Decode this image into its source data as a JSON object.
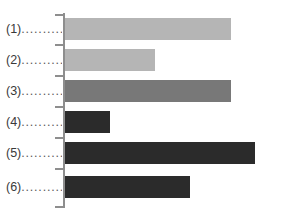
{
  "chart_data": {
    "type": "bar",
    "orientation": "horizontal",
    "title": "",
    "subtitle": "",
    "xlabel": "",
    "ylabel": "",
    "grid": false,
    "legend": null,
    "legend_position": "none",
    "axis": {
      "y_axis_visible": true,
      "x_axis_visible": false,
      "y_tick_marks": 7,
      "xlim": [
        0,
        200
      ],
      "ylim": null,
      "x_tick_labels": []
    },
    "categories": [
      "(1)",
      "(2)",
      "(3)",
      "(4)",
      "(5)",
      "(6)"
    ],
    "category_leaders": [
      "..........",
      "..........",
      "..........",
      "..........",
      "..........",
      ".........."
    ],
    "values": [
      166,
      90,
      166,
      45,
      190,
      125
    ],
    "bar_colors": [
      "#b5b5b5",
      "#b5b5b5",
      "#787878",
      "#2b2b2b",
      "#2b2b2b",
      "#2b2b2b"
    ],
    "bars": [
      {
        "category": "(1)",
        "value": 166,
        "color": "#b5b5b5",
        "pixel_end": 231
      },
      {
        "category": "(2)",
        "value": 90,
        "color": "#b5b5b5",
        "pixel_end": 155
      },
      {
        "category": "(3)",
        "value": 166,
        "color": "#787878",
        "pixel_end": 231
      },
      {
        "category": "(4)",
        "value": 45,
        "color": "#2b2b2b",
        "pixel_end": 110
      },
      {
        "category": "(5)",
        "value": 190,
        "color": "#2b2b2b",
        "pixel_end": 255
      },
      {
        "category": "(6)",
        "value": 125,
        "color": "#2b2b2b",
        "pixel_end": 190
      }
    ],
    "colors": {
      "background": "#ffffff",
      "axis": "#8e8e8e",
      "label_text": "#3a3a3a",
      "light_gray_bar": "#b5b5b5",
      "medium_gray_bar": "#787878",
      "dark_bar": "#2b2b2b"
    }
  },
  "layout": {
    "bar_origin_x": 65,
    "bar_height": 22,
    "bar_pitch": 31,
    "bar_tops": [
      18,
      49,
      80,
      111,
      142,
      176
    ],
    "axis_x": 63,
    "axis_top": 13,
    "axis_bottom": 208,
    "tick_ys": [
      14,
      44,
      75,
      106,
      137,
      168,
      206
    ],
    "label_centers": [
      29,
      60,
      91,
      122,
      153,
      187
    ]
  }
}
